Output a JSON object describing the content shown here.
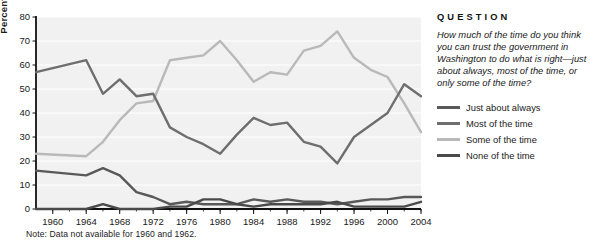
{
  "panel": {
    "heading": "QUESTION",
    "question": "How much of the time do you think you can trust the government in Washington to do what is right—just about always, most of the time, or only some of the time?"
  },
  "note": "Note:  Data not available for 1960 and 1962.",
  "colors": {
    "just_about_always": "#595959",
    "most_of_the_time": "#6e6e6e",
    "some_of_the_time": "#b9b9b9",
    "none_of_the_time": "#4a4a4a",
    "plot_background": "#f1f1f1",
    "gridline": "#ffffff",
    "axis": "#111111",
    "text": "#1a1a1a"
  },
  "chart_data": {
    "type": "line",
    "title": "",
    "xlabel": "",
    "ylabel": "Percentage",
    "xlim": [
      1958,
      2004
    ],
    "ylim": [
      0,
      80
    ],
    "yticks": [
      0,
      10,
      20,
      30,
      40,
      50,
      60,
      70,
      80
    ],
    "xticks": [
      1960,
      1964,
      1968,
      1972,
      1976,
      1980,
      1984,
      1988,
      1992,
      1996,
      2000,
      2004
    ],
    "xtick_labels": [
      "1960",
      "1964",
      "1968",
      "1972",
      "1976",
      "1980",
      "1984",
      "1988",
      "1992",
      "1996",
      "2000",
      "2004"
    ],
    "xminor_step": 2,
    "grid": true,
    "legend_position": "right",
    "x": [
      1958,
      1964,
      1966,
      1968,
      1970,
      1972,
      1974,
      1976,
      1978,
      1980,
      1982,
      1984,
      1986,
      1988,
      1990,
      1992,
      1994,
      1996,
      1998,
      2000,
      2002,
      2004
    ],
    "series": [
      {
        "name": "Just about always",
        "color": "#595959",
        "values": [
          16,
          14,
          17,
          14,
          7,
          5,
          2,
          3,
          2,
          2,
          2,
          4,
          3,
          4,
          3,
          3,
          2,
          3,
          4,
          4,
          5,
          5
        ]
      },
      {
        "name": "Most of the time",
        "color": "#6e6e6e",
        "values": [
          57,
          62,
          48,
          54,
          47,
          48,
          34,
          30,
          27,
          23,
          31,
          38,
          35,
          36,
          28,
          26,
          19,
          30,
          35,
          40,
          52,
          47
        ]
      },
      {
        "name": "Some of the time",
        "color": "#b9b9b9",
        "values": [
          23,
          22,
          28,
          37,
          44,
          45,
          62,
          63,
          64,
          70,
          62,
          53,
          57,
          56,
          66,
          68,
          74,
          63,
          58,
          55,
          44,
          32
        ]
      },
      {
        "name": "None of the time",
        "color": "#4a4a4a",
        "values": [
          0,
          0,
          2,
          0,
          0,
          0,
          1,
          1,
          4,
          4,
          2,
          1,
          2,
          2,
          2,
          2,
          3,
          1,
          1,
          1,
          1,
          3
        ]
      }
    ]
  }
}
